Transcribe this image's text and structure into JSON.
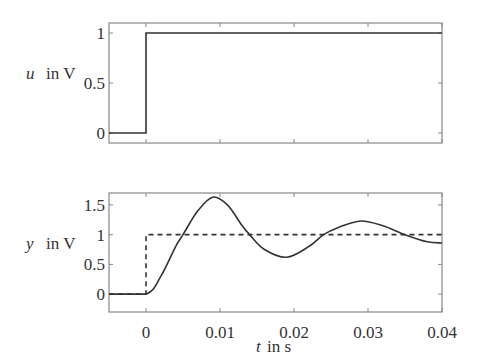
{
  "chart_data": [
    {
      "type": "line",
      "title": "",
      "xlabel": "",
      "ylabel": "u in V",
      "ylabel_var": "u",
      "ylabel_unit": "in V",
      "xlim": [
        -0.005,
        0.04
      ],
      "ylim": [
        -0.1,
        1.1
      ],
      "xticks": [
        0,
        0.01,
        0.02,
        0.03,
        0.04
      ],
      "yticks": [
        "0",
        "0.5",
        "1"
      ],
      "grid": false,
      "series": [
        {
          "name": "u (step input)",
          "style": "solid",
          "x": [
            -0.005,
            0,
            0,
            0.04
          ],
          "y": [
            0,
            0,
            1,
            1
          ]
        }
      ]
    },
    {
      "type": "line",
      "title": "",
      "xlabel": "t in s",
      "xlabel_var": "t",
      "xlabel_unit": "in s",
      "ylabel": "y in V",
      "ylabel_var": "y",
      "ylabel_unit": "in V",
      "xlim": [
        -0.005,
        0.04
      ],
      "ylim": [
        -0.3,
        1.7
      ],
      "xticks": [
        "0",
        "0.01",
        "0.02",
        "0.03",
        "0.04"
      ],
      "yticks": [
        "0",
        "0.5",
        "1",
        "1.5"
      ],
      "grid": false,
      "series": [
        {
          "name": "y (step response)",
          "style": "solid",
          "x": [
            -0.005,
            0,
            0.002,
            0.004,
            0.005,
            0.007,
            0.009,
            0.011,
            0.013,
            0.014,
            0.016,
            0.019,
            0.022,
            0.024,
            0.026,
            0.029,
            0.032,
            0.035,
            0.038,
            0.04
          ],
          "y": [
            0,
            0,
            0.3,
            0.8,
            1.0,
            1.4,
            1.63,
            1.5,
            1.15,
            1.0,
            0.75,
            0.62,
            0.8,
            1.0,
            1.12,
            1.23,
            1.15,
            1.0,
            0.88,
            0.86
          ]
        },
        {
          "name": "reference step",
          "style": "dashed",
          "x": [
            -0.005,
            0,
            0,
            0.04
          ],
          "y": [
            0,
            0,
            1,
            1
          ]
        }
      ]
    }
  ]
}
